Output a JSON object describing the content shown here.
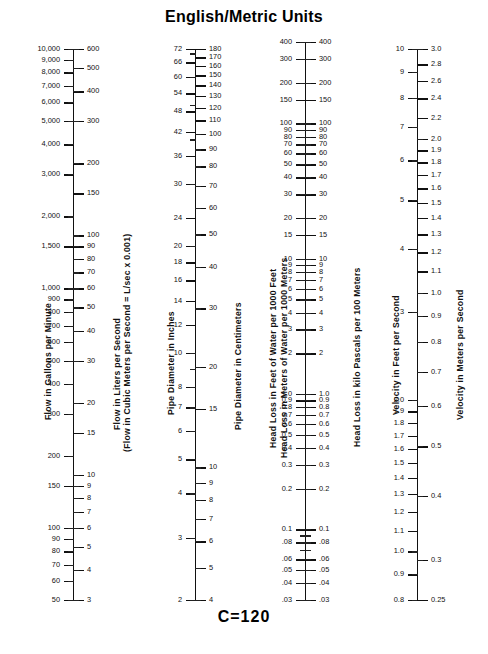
{
  "title": "English/Metric Units",
  "footer_note": "C=120",
  "chart_data": {
    "type": "nomograph",
    "title": "English/Metric Units",
    "annotations": [
      "C=120"
    ],
    "scales": [
      {
        "id": "flow",
        "english_label": "Flow in Gallons per Minute",
        "metric_label": "Flow in Liters per Second",
        "metric_sublabel": "(Flow in Cubic Meters per Second = L/sec x 0.001)",
        "english_min": 50,
        "english_max": 10000,
        "metric_min": 3,
        "metric_max": 600,
        "english_ticks": [
          10000,
          9000,
          8000,
          7000,
          6000,
          5000,
          4000,
          3000,
          2000,
          1500,
          1000,
          900,
          800,
          700,
          600,
          500,
          400,
          300,
          200,
          150,
          100,
          90,
          80,
          70,
          60,
          50
        ],
        "english_labels": [
          "10,000",
          "9,000",
          "8,000",
          "7,000",
          "6,000",
          "5,000",
          "4,000",
          "3,000",
          "2,000",
          "1,500",
          "1,000",
          "900",
          "800",
          "700",
          "600",
          "500",
          "400",
          "300",
          "200",
          "150",
          "100",
          "90",
          "80",
          "70",
          "60",
          "50"
        ],
        "metric_ticks": [
          600,
          500,
          400,
          300,
          200,
          150,
          100,
          90,
          80,
          70,
          60,
          50,
          40,
          30,
          20,
          15,
          10,
          9,
          8,
          7,
          6,
          5,
          4,
          3
        ],
        "metric_labels": [
          "600",
          "500",
          "400",
          "300",
          "200",
          "150",
          "100",
          "90",
          "80",
          "70",
          "60",
          "50",
          "40",
          "30",
          "20",
          "15",
          "10",
          "9",
          "8",
          "7",
          "6",
          "5",
          "4",
          "3"
        ]
      },
      {
        "id": "diameter",
        "english_label": "Pipe Diameter in Inches",
        "metric_label": "Pipe Diameter in Centimeters",
        "english_min": 2,
        "english_max": 72,
        "metric_min": 4,
        "metric_max": 180,
        "english_ticks": [
          72,
          66,
          60,
          54,
          48,
          42,
          36,
          30,
          24,
          20,
          18,
          16,
          14,
          12,
          10,
          8,
          7,
          6,
          5,
          4,
          3,
          2
        ],
        "english_labels": [
          "72",
          "66",
          "60",
          "54",
          "48",
          "42",
          "36",
          "30",
          "24",
          "20",
          "18",
          "16",
          "14",
          "12",
          "10",
          "8",
          "7",
          "6",
          "5",
          "4",
          "3",
          "2"
        ],
        "metric_ticks": [
          180,
          170,
          160,
          150,
          140,
          130,
          120,
          110,
          100,
          90,
          80,
          70,
          60,
          50,
          40,
          30,
          20,
          15,
          10,
          9,
          8,
          7,
          6,
          5,
          4
        ],
        "metric_labels": [
          "180",
          "170",
          "160",
          "150",
          "140",
          "130",
          "120",
          "110",
          "100",
          "90",
          "80",
          "70",
          "60",
          "50",
          "40",
          "30",
          "20",
          "15",
          "10",
          "9",
          "8",
          "7",
          "6",
          "5",
          "4"
        ]
      },
      {
        "id": "headloss",
        "english_label": "Head Loss in Feet of Water per 1000 Feet",
        "metric_label": "Head Loss in Meters of Water per 1000 Meters",
        "metric_label2": "Head Loss in kilo Pascals per 100 Meters",
        "english_min": 0.03,
        "english_max": 400,
        "metric_min": 0.03,
        "metric_max": 400,
        "english_ticks": [
          0.03,
          0.04,
          0.05,
          0.06,
          0.08,
          0.1,
          0.2,
          0.3,
          0.4,
          0.5,
          0.6,
          0.7,
          0.8,
          0.9,
          1.0,
          2,
          3,
          4,
          5,
          6,
          7,
          8,
          9,
          10,
          15,
          20,
          30,
          40,
          50,
          60,
          70,
          80,
          90,
          100,
          150,
          200,
          300,
          400
        ],
        "english_labels": [
          ".03",
          ".04",
          ".05",
          ".06",
          ".08",
          "0.1",
          "0.2",
          "0.3",
          "0.4",
          "0.5",
          "0.6",
          "0.7",
          "0.8",
          "0.9",
          "1.0",
          "2",
          "3",
          "4",
          "5",
          "6",
          "7",
          "8",
          "9",
          "10",
          "15",
          "20",
          "30",
          "40",
          "50",
          "60",
          "70",
          "80",
          "90",
          "100",
          "150",
          "200",
          "300",
          "400"
        ],
        "metric_ticks": [
          0.03,
          0.04,
          0.05,
          0.06,
          0.08,
          0.1,
          0.2,
          0.3,
          0.4,
          0.5,
          0.6,
          0.7,
          0.8,
          0.9,
          1.0,
          2,
          3,
          4,
          5,
          6,
          7,
          8,
          9,
          10,
          15,
          20,
          30,
          40,
          50,
          60,
          70,
          80,
          90,
          100,
          150,
          200,
          300,
          400
        ],
        "metric_labels": [
          ".03",
          ".04",
          ".05",
          ".06",
          ".08",
          "0.1",
          "0.2",
          "0.3",
          "0.4",
          "0.5",
          "0.6",
          "0.7",
          "0.8",
          "0.9",
          "1.0",
          "2",
          "3",
          "4",
          "5",
          "6",
          "7",
          "8",
          "9",
          "10",
          "15",
          "20",
          "30",
          "40",
          "50",
          "60",
          "70",
          "80",
          "90",
          "100",
          "150",
          "200",
          "300",
          "400"
        ]
      },
      {
        "id": "velocity",
        "english_label": "Velocity in Feet per Second",
        "metric_label": "Velocity in Meters per Second",
        "english_min": 0.8,
        "english_max": 10,
        "metric_min": 0.25,
        "metric_max": 3.0,
        "english_ticks": [
          0.8,
          0.9,
          1.0,
          1.1,
          1.2,
          1.3,
          1.4,
          1.5,
          1.6,
          1.7,
          1.8,
          1.9,
          2.0,
          3,
          4,
          5,
          6,
          7,
          8,
          9,
          10
        ],
        "english_labels": [
          "0.8",
          "0.9",
          "1.0",
          "1.1",
          "1.2",
          "1.3",
          "1.4",
          "1.5",
          "1.6",
          "1.7",
          "1.8",
          "1.9",
          "2.0",
          "3",
          "4",
          "5",
          "6",
          "7",
          "8",
          "9",
          "10"
        ],
        "metric_ticks": [
          0.25,
          0.3,
          0.4,
          0.5,
          0.6,
          0.7,
          0.8,
          0.9,
          1.0,
          1.1,
          1.2,
          1.3,
          1.4,
          1.5,
          1.6,
          1.7,
          1.8,
          1.9,
          2.0,
          2.2,
          2.4,
          2.6,
          2.8,
          3.0
        ],
        "metric_labels": [
          "0.25",
          "0.3",
          "0.4",
          "0.5",
          "0.6",
          "0.7",
          "0.8",
          "0.9",
          "1.0",
          "1.1",
          "1.2",
          "1.3",
          "1.4",
          "1.5",
          "1.6",
          "1.7",
          "1.8",
          "1.9",
          "2.0",
          "2.2",
          "2.4",
          "2.6",
          "2.8",
          "3.0"
        ]
      }
    ]
  },
  "layout": {
    "scales": [
      {
        "axis_x": 73,
        "top_y": 49,
        "bottom_y": 600,
        "english_anchor": {
          "y_top": 49,
          "y_bottom": 600
        },
        "metric_anchor": {
          "y_top": 50,
          "y_bottom": 600
        },
        "caption_english": {
          "x": 43,
          "y": 420
        },
        "caption_metric": {
          "x": 112,
          "y": 430
        },
        "caption_metric2": {
          "x": 122,
          "y": 452
        }
      },
      {
        "axis_x": 195,
        "top_y": 49,
        "bottom_y": 600,
        "caption_english": {
          "x": 166,
          "y": 415
        },
        "caption_metric": {
          "x": 233,
          "y": 430
        }
      },
      {
        "axis_x": 305,
        "top_y": 42,
        "bottom_y": 600,
        "caption_english": {
          "x": 268,
          "y": 448
        },
        "caption_metric": {
          "x": 279,
          "y": 458
        },
        "caption_metric2": {
          "x": 352,
          "y": 447
        }
      },
      {
        "axis_x": 417,
        "top_y": 49,
        "bottom_y": 600,
        "caption_english": {
          "x": 391,
          "y": 415
        },
        "caption_metric": {
          "x": 455,
          "y": 420
        }
      }
    ]
  }
}
